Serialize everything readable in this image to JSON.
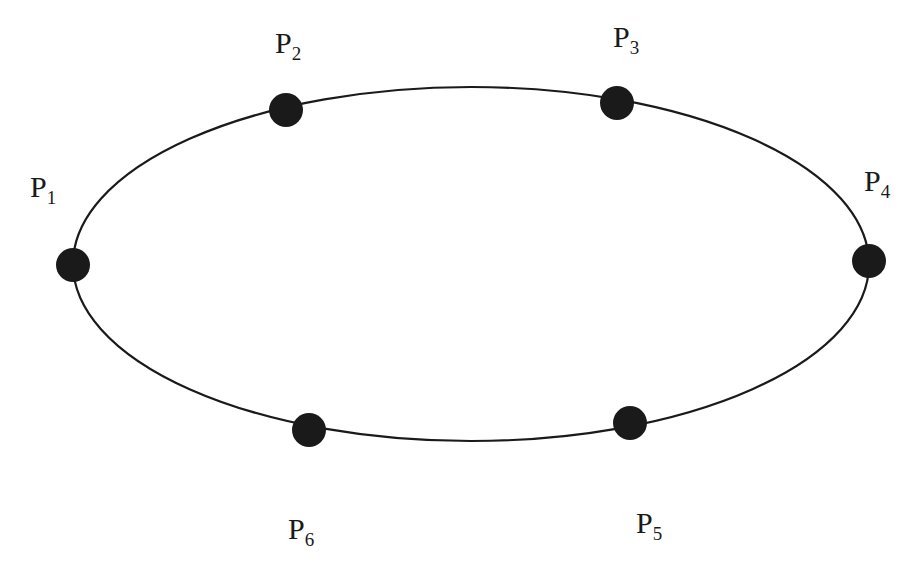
{
  "diagram": {
    "title": "",
    "shape": "ellipse",
    "ellipse": {
      "cx": 471,
      "cy": 264,
      "rx": 398,
      "ry": 177,
      "stroke": "#1a1a1a",
      "stroke_width": 2.2
    },
    "point_color": "#1a1a1a",
    "point_radius": 17,
    "points": [
      {
        "id": "P1",
        "base": "P",
        "sub": "1",
        "x": 73,
        "y": 265,
        "label_x": 30,
        "label_y": 172
      },
      {
        "id": "P2",
        "base": "P",
        "sub": "2",
        "x": 286,
        "y": 110,
        "label_x": 275,
        "label_y": 28
      },
      {
        "id": "P3",
        "base": "P",
        "sub": "3",
        "x": 617,
        "y": 103,
        "label_x": 613,
        "label_y": 22
      },
      {
        "id": "P4",
        "base": "P",
        "sub": "4",
        "x": 869,
        "y": 261,
        "label_x": 864,
        "label_y": 166
      },
      {
        "id": "P5",
        "base": "P",
        "sub": "5",
        "x": 630,
        "y": 423,
        "label_x": 636,
        "label_y": 508
      },
      {
        "id": "P6",
        "base": "P",
        "sub": "6",
        "x": 309,
        "y": 430,
        "label_x": 288,
        "label_y": 514
      }
    ]
  }
}
